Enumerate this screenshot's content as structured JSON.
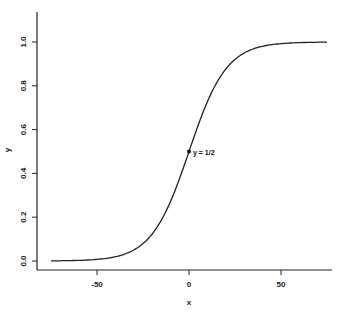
{
  "chart_data": {
    "type": "line",
    "title": "",
    "xlabel": "x",
    "ylabel": "y",
    "xlim": [
      -75,
      75
    ],
    "ylim": [
      0,
      1
    ],
    "x_ticks": [
      -50,
      0,
      50
    ],
    "x_tick_labels": [
      "-50",
      "0",
      "50"
    ],
    "y_ticks": [
      0.0,
      0.2,
      0.4,
      0.6,
      0.8,
      1.0
    ],
    "y_tick_labels": [
      "0.0",
      "0.2",
      "0.4",
      "0.6",
      "0.8",
      "1.0"
    ],
    "grid": false,
    "legend": null,
    "series": [
      {
        "name": "logistic curve",
        "x": [
          -75,
          -60,
          -50,
          -40,
          -30,
          -20,
          -10,
          0,
          10,
          20,
          30,
          40,
          50,
          60,
          75
        ],
        "y": [
          0.0,
          0.003,
          0.007,
          0.018,
          0.047,
          0.12,
          0.27,
          0.5,
          0.73,
          0.88,
          0.953,
          0.982,
          0.993,
          0.997,
          1.0
        ]
      }
    ],
    "annotations": [
      {
        "x": 0,
        "y": 0.5,
        "text": "y = 1/2",
        "marker": "dot"
      }
    ]
  }
}
